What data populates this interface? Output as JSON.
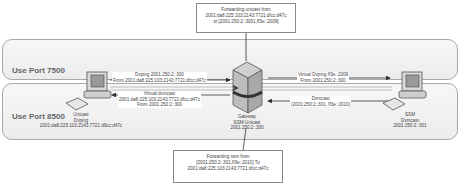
{
  "zones": [
    {
      "label": "Use Port 7500"
    },
    {
      "label": "Use Port 8500"
    }
  ],
  "notes": {
    "top": {
      "lines": [
        "Forwarding unicast from",
        "2001:da8:225:103:2143:7721:dfcc:d47c",
        "to [2001:250:2::3001,ff3e::2009]"
      ]
    },
    "bottom": {
      "lines": [
        "Forwarding ssm from",
        "[2001:250:2::301,ff3e::2010] To",
        "2001:da8:225:103:2143:7721:dfcc:d47c"
      ]
    }
  },
  "nodes": {
    "left_host": {
      "lines": [
        "Unicast",
        "Dvping",
        "2001:da8:225:103:2143:7721:d9cc:d47c"
      ]
    },
    "gateway": {
      "lines": [
        "Gateway",
        "SSM-Unicast",
        "2001:250:2::300"
      ]
    },
    "right_host": {
      "lines": [
        "SSM",
        "Dvmcast",
        "2001:250:2::301"
      ]
    }
  },
  "flows": {
    "dvping": [
      "Dvping 2001:250:2::300",
      "From 2001:da8:225:103:2143:7721:dfcc:d47c"
    ],
    "virtual_dvmcast": [
      "Virtual dvmcast",
      "2001:da8:225:103:2143:7721:dfcc:d47c",
      "From 2001:250:2::300"
    ],
    "virtual_dvping": [
      "Virtual Dvping ff3e::2009",
      "From 2001:250:2::300"
    ],
    "dvmcast": [
      "Dvmcast",
      "(2001:250:2::301, ff3e::2010)"
    ]
  },
  "colors": {
    "zone_border": "#a9a9a9",
    "zone_fill": "#f2f2f2",
    "line": "#444444",
    "text": "#444444"
  }
}
